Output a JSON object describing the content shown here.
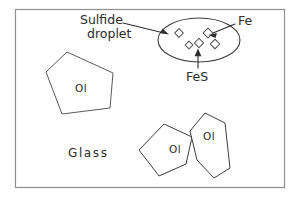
{
  "figure": {
    "kind": "schematic-line-drawing",
    "frame": {
      "x": 15,
      "y": 9,
      "width": 270,
      "height": 179,
      "border_color": "#8f8f8f",
      "background_color": "#ffffff"
    },
    "annotations": [
      {
        "id": "sulfide-droplet",
        "label_line_1": "Sulfide",
        "label_line_2": "droplet",
        "text_x": 80,
        "text_y": 24,
        "leader": {
          "x1": 123,
          "y1": 23,
          "x2": 168,
          "y2": 34
        },
        "color": "#2b2b2b"
      },
      {
        "id": "fe",
        "label": "Fe",
        "text_x": 238,
        "text_y": 25,
        "leader": {
          "x1": 235,
          "y1": 25,
          "x2": 209,
          "y2": 35
        },
        "color": "#2b2b2b"
      },
      {
        "id": "fes",
        "label": "FeS",
        "text_x": 186,
        "text_y": 81,
        "leader": {
          "x1": 198,
          "y1": 70,
          "x2": 198,
          "y2": 50
        },
        "color": "#2b2b2b"
      }
    ],
    "droplet": {
      "id": "sulfide-droplet-ellipse",
      "cx": 199,
      "cy": 40,
      "rx": 41,
      "ry": 22,
      "stroke_color": "#3d3d3d",
      "inclusions": [
        {
          "id": "fes-grain-1",
          "cx": 179,
          "cy": 33,
          "size": 6.2,
          "rot": 45,
          "phase": "FeS"
        },
        {
          "id": "fes-grain-2",
          "cx": 189,
          "cy": 45,
          "size": 5.6,
          "rot": 45,
          "phase": "FeS"
        },
        {
          "id": "fes-grain-3",
          "cx": 199,
          "cy": 43,
          "size": 6.6,
          "rot": 45,
          "phase": "FeS"
        },
        {
          "id": "fes-grain-4",
          "cx": 215,
          "cy": 44,
          "size": 6.8,
          "rot": 45,
          "phase": "FeS"
        },
        {
          "id": "fe-grain-1",
          "cx": 208,
          "cy": 33,
          "size": 7.0,
          "rot": 45,
          "phase": "Fe"
        }
      ]
    },
    "grains": [
      {
        "id": "olivine-large",
        "label": "Ol",
        "label_x": 75,
        "label_y": 92,
        "points": "67,52 113,73 110,108 62,114 46,72",
        "stroke_color": "#5a5a5a"
      },
      {
        "id": "olivine-lower-left",
        "label": "Ol",
        "label_x": 169,
        "label_y": 153,
        "points": "164,124 192,137 186,164 159,176 139,150"
      },
      {
        "id": "olivine-lower-right",
        "label": "Ol",
        "label_x": 203,
        "label_y": 140,
        "points": "205,113 225,123 230,168 214,178 197,160 190,131"
      }
    ],
    "matrix": {
      "id": "glass-matrix",
      "label": "Glass",
      "label_x": 68,
      "label_y": 157
    }
  }
}
